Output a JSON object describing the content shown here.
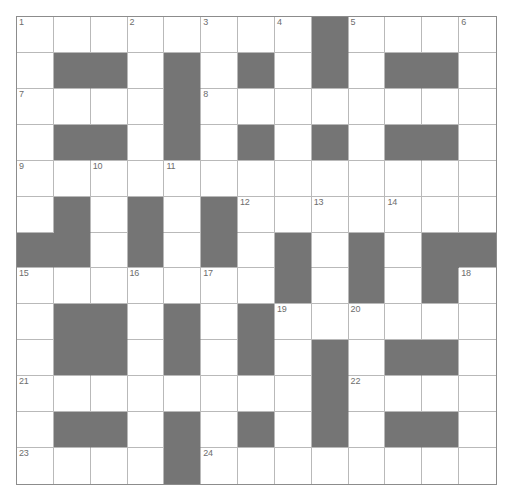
{
  "puzzle": {
    "title": "Crossword Grid",
    "type": "crossword",
    "rows": 13,
    "columns": 13,
    "colors": {
      "background": "#ffffff",
      "block": "#757575",
      "grid_line": "#b9b9b9",
      "frame": "#8c8c8c",
      "number_text": "#6d6d6d"
    },
    "legend": {
      "white_cell": "open letter square",
      "black_cell": "blocked square"
    },
    "grid": [
      [
        "white",
        "white",
        "white",
        "white",
        "white",
        "white",
        "white",
        "white",
        "block",
        "white",
        "white",
        "white",
        "white"
      ],
      [
        "white",
        "block",
        "block",
        "white",
        "block",
        "white",
        "block",
        "white",
        "block",
        "white",
        "block",
        "block",
        "white"
      ],
      [
        "white",
        "white",
        "white",
        "white",
        "block",
        "white",
        "white",
        "white",
        "white",
        "white",
        "white",
        "white",
        "white"
      ],
      [
        "white",
        "block",
        "block",
        "white",
        "block",
        "white",
        "block",
        "white",
        "block",
        "white",
        "block",
        "block",
        "white"
      ],
      [
        "white",
        "white",
        "white",
        "white",
        "white",
        "white",
        "white",
        "white",
        "white",
        "white",
        "white",
        "white",
        "white"
      ],
      [
        "white",
        "block",
        "white",
        "block",
        "white",
        "block",
        "white",
        "white",
        "white",
        "white",
        "white",
        "white",
        "white"
      ],
      [
        "block",
        "block",
        "white",
        "block",
        "white",
        "block",
        "white",
        "block",
        "white",
        "block",
        "white",
        "block",
        "block"
      ],
      [
        "white",
        "white",
        "white",
        "white",
        "white",
        "white",
        "white",
        "block",
        "white",
        "block",
        "white",
        "block",
        "white"
      ],
      [
        "white",
        "block",
        "block",
        "white",
        "block",
        "white",
        "block",
        "white",
        "white",
        "white",
        "white",
        "white",
        "white"
      ],
      [
        "white",
        "block",
        "block",
        "white",
        "block",
        "white",
        "block",
        "white",
        "block",
        "white",
        "block",
        "block",
        "white"
      ],
      [
        "white",
        "white",
        "white",
        "white",
        "white",
        "white",
        "white",
        "white",
        "block",
        "white",
        "white",
        "white",
        "white"
      ],
      [
        "white",
        "block",
        "block",
        "white",
        "block",
        "white",
        "block",
        "white",
        "block",
        "white",
        "block",
        "block",
        "white"
      ],
      [
        "white",
        "white",
        "white",
        "white",
        "block",
        "white",
        "white",
        "white",
        "white",
        "white",
        "white",
        "white",
        "white"
      ]
    ],
    "numbers": [
      {
        "number": "1",
        "row": 0,
        "col": 0
      },
      {
        "number": "2",
        "row": 0,
        "col": 3
      },
      {
        "number": "3",
        "row": 0,
        "col": 5
      },
      {
        "number": "4",
        "row": 0,
        "col": 7
      },
      {
        "number": "5",
        "row": 0,
        "col": 9
      },
      {
        "number": "6",
        "row": 0,
        "col": 12
      },
      {
        "number": "7",
        "row": 2,
        "col": 0
      },
      {
        "number": "8",
        "row": 2,
        "col": 5
      },
      {
        "number": "9",
        "row": 4,
        "col": 0
      },
      {
        "number": "10",
        "row": 4,
        "col": 2
      },
      {
        "number": "11",
        "row": 4,
        "col": 4
      },
      {
        "number": "12",
        "row": 5,
        "col": 6
      },
      {
        "number": "13",
        "row": 5,
        "col": 8
      },
      {
        "number": "14",
        "row": 5,
        "col": 10
      },
      {
        "number": "15",
        "row": 7,
        "col": 0
      },
      {
        "number": "16",
        "row": 7,
        "col": 3
      },
      {
        "number": "17",
        "row": 7,
        "col": 5
      },
      {
        "number": "18",
        "row": 7,
        "col": 12
      },
      {
        "number": "19",
        "row": 8,
        "col": 7
      },
      {
        "number": "20",
        "row": 8,
        "col": 9
      },
      {
        "number": "21",
        "row": 10,
        "col": 0
      },
      {
        "number": "22",
        "row": 10,
        "col": 9
      },
      {
        "number": "23",
        "row": 12,
        "col": 0
      },
      {
        "number": "24",
        "row": 12,
        "col": 5
      }
    ]
  }
}
